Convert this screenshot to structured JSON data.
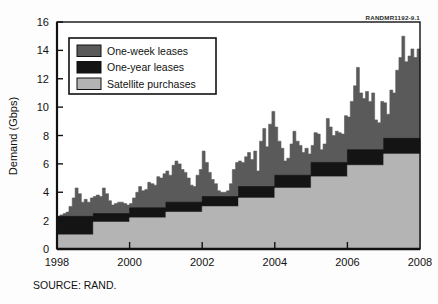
{
  "figure": {
    "document_code": "RANDMR1192-9.1",
    "source_note": "SOURCE: RAND."
  },
  "legend": {
    "position": "upper-left-inside",
    "items": [
      {
        "label": "One-week leases",
        "color": "#5a5a5a",
        "key": "one_week_leases"
      },
      {
        "label": "One-year leases",
        "color": "#141414",
        "key": "one_year_leases"
      },
      {
        "label": "Satellite purchases",
        "color": "#b4b4b4",
        "key": "satellite_purchases"
      }
    ]
  },
  "axes": {
    "y_title": "Demand (Gbps)",
    "x_title": "",
    "y_ticks": [
      "0",
      "2",
      "4",
      "6",
      "8",
      "10",
      "12",
      "14",
      "16"
    ],
    "x_ticks": [
      "1998",
      "2000",
      "2002",
      "2004",
      "2006",
      "2008"
    ]
  },
  "chart_data": {
    "type": "area",
    "title": "",
    "subtitle": "",
    "xlabel": "",
    "ylabel": "Demand (Gbps)",
    "xlim": [
      1998,
      2008
    ],
    "ylim": [
      0,
      16
    ],
    "ytick_step": 2,
    "xtick_step": 2,
    "grid": false,
    "stacked": true,
    "legend_position": "upper left",
    "annotations": [
      "RANDMR1192-9.1",
      "SOURCE: RAND."
    ],
    "series_order": [
      "satellite_purchases",
      "one_year_leases",
      "one_week_leases"
    ],
    "series": [
      {
        "name": "Satellite purchases",
        "color": "#b4b4b4",
        "type": "step",
        "note": "Annual step increases in purchased satellite capacity",
        "steps": [
          {
            "year_start": 1998,
            "year_end": 1999,
            "value": 1.0
          },
          {
            "year_start": 1999,
            "year_end": 2000,
            "value": 1.9
          },
          {
            "year_start": 2000,
            "year_end": 2001,
            "value": 2.2
          },
          {
            "year_start": 2001,
            "year_end": 2002,
            "value": 2.6
          },
          {
            "year_start": 2002,
            "year_end": 2003,
            "value": 3.0
          },
          {
            "year_start": 2003,
            "year_end": 2004,
            "value": 3.6
          },
          {
            "year_start": 2004,
            "year_end": 2005,
            "value": 4.3
          },
          {
            "year_start": 2005,
            "year_end": 2006,
            "value": 5.1
          },
          {
            "year_start": 2006,
            "year_end": 2007,
            "value": 5.9
          },
          {
            "year_start": 2007,
            "year_end": 2008,
            "value": 6.7
          }
        ]
      },
      {
        "name": "One-year leases",
        "color": "#141414",
        "type": "step",
        "note": "Cumulative top of satellite purchases plus one-year leases",
        "steps": [
          {
            "year_start": 1998,
            "year_end": 1999,
            "value": 2.3
          },
          {
            "year_start": 1999,
            "year_end": 2000,
            "value": 2.5
          },
          {
            "year_start": 2000,
            "year_end": 2001,
            "value": 2.9
          },
          {
            "year_start": 2001,
            "year_end": 2002,
            "value": 3.3
          },
          {
            "year_start": 2002,
            "year_end": 2003,
            "value": 3.7
          },
          {
            "year_start": 2003,
            "year_end": 2004,
            "value": 4.4
          },
          {
            "year_start": 2004,
            "year_end": 2005,
            "value": 5.2
          },
          {
            "year_start": 2005,
            "year_end": 2006,
            "value": 6.1
          },
          {
            "year_start": 2006,
            "year_end": 2007,
            "value": 7.0
          },
          {
            "year_start": 2007,
            "year_end": 2008,
            "value": 7.8
          }
        ]
      },
      {
        "name": "One-week leases",
        "color": "#5a5a5a",
        "type": "volatile-total",
        "note": "Total demand including short-term one-week leases; volatile weekly series",
        "x": [
          1998.0,
          1998.08,
          1998.17,
          1998.25,
          1998.33,
          1998.42,
          1998.5,
          1998.58,
          1998.67,
          1998.75,
          1998.83,
          1998.92,
          1999.0,
          1999.08,
          1999.17,
          1999.25,
          1999.33,
          1999.42,
          1999.5,
          1999.58,
          1999.67,
          1999.75,
          1999.83,
          1999.92,
          2000.0,
          2000.08,
          2000.17,
          2000.25,
          2000.33,
          2000.42,
          2000.5,
          2000.58,
          2000.67,
          2000.75,
          2000.83,
          2000.92,
          2001.0,
          2001.08,
          2001.17,
          2001.25,
          2001.33,
          2001.42,
          2001.5,
          2001.58,
          2001.67,
          2001.75,
          2001.83,
          2001.92,
          2002.0,
          2002.08,
          2002.17,
          2002.25,
          2002.33,
          2002.42,
          2002.5,
          2002.58,
          2002.67,
          2002.75,
          2002.83,
          2002.92,
          2003.0,
          2003.08,
          2003.17,
          2003.25,
          2003.33,
          2003.42,
          2003.5,
          2003.58,
          2003.67,
          2003.75,
          2003.83,
          2003.92,
          2004.0,
          2004.08,
          2004.17,
          2004.25,
          2004.33,
          2004.42,
          2004.5,
          2004.58,
          2004.67,
          2004.75,
          2004.83,
          2004.92,
          2005.0,
          2005.08,
          2005.17,
          2005.25,
          2005.33,
          2005.42,
          2005.5,
          2005.58,
          2005.67,
          2005.75,
          2005.83,
          2005.92,
          2006.0,
          2006.08,
          2006.17,
          2006.25,
          2006.33,
          2006.42,
          2006.5,
          2006.58,
          2006.67,
          2006.75,
          2006.83,
          2006.92,
          2007.0,
          2007.08,
          2007.17,
          2007.25,
          2007.33,
          2007.42,
          2007.5,
          2007.58,
          2007.67,
          2007.75,
          2007.83,
          2007.92,
          2008.0
        ],
        "y": [
          2.3,
          2.4,
          2.5,
          2.6,
          3.0,
          3.6,
          4.3,
          3.9,
          3.3,
          3.5,
          3.3,
          3.6,
          3.7,
          3.8,
          3.7,
          4.3,
          3.9,
          3.4,
          3.1,
          3.2,
          3.3,
          3.3,
          3.2,
          3.1,
          3.2,
          3.6,
          4.0,
          4.4,
          4.1,
          4.2,
          4.7,
          4.6,
          4.5,
          5.1,
          5.0,
          5.3,
          5.5,
          5.2,
          5.9,
          6.2,
          6.0,
          5.6,
          5.4,
          5.0,
          4.5,
          4.4,
          5.2,
          5.6,
          6.9,
          6.1,
          5.4,
          4.9,
          4.6,
          4.1,
          4.0,
          4.0,
          4.1,
          4.6,
          5.6,
          6.1,
          6.2,
          6.1,
          6.5,
          6.8,
          6.3,
          6.9,
          5.5,
          7.6,
          8.5,
          7.2,
          8.8,
          9.7,
          8.6,
          7.6,
          7.1,
          6.2,
          6.4,
          7.4,
          8.3,
          7.6,
          7.3,
          6.8,
          7.1,
          6.7,
          7.3,
          8.2,
          8.1,
          7.0,
          7.4,
          9.2,
          8.6,
          8.0,
          8.3,
          8.2,
          8.1,
          9.4,
          9.3,
          10.4,
          11.5,
          12.8,
          11.0,
          10.6,
          11.1,
          10.4,
          11.0,
          9.1,
          8.9,
          10.4,
          10.3,
          9.5,
          11.2,
          11.0,
          12.6,
          13.5,
          15.0,
          13.2,
          13.6,
          14.1,
          13.5,
          14.1,
          12.5
        ]
      }
    ]
  }
}
